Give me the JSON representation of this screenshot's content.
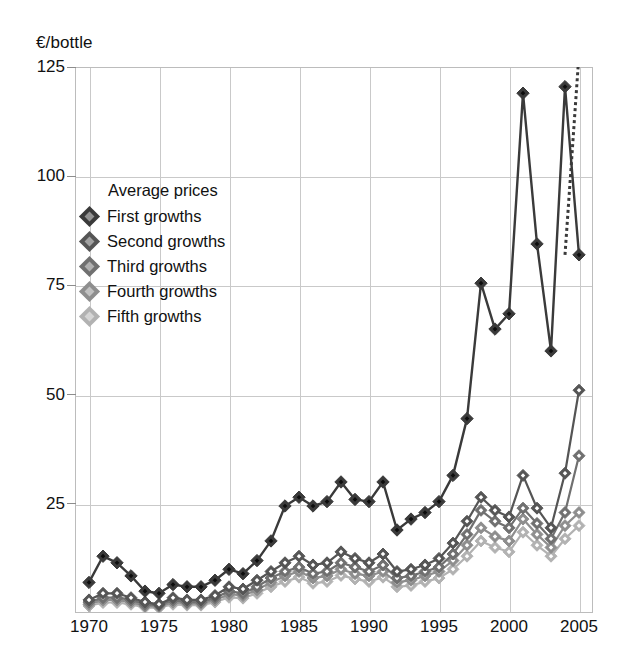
{
  "chart_data": {
    "type": "line",
    "title": "",
    "ylabel": "€/bottle",
    "xlabel": "",
    "xlim": [
      1969,
      2006
    ],
    "ylim": [
      0,
      125
    ],
    "yticks": [
      0,
      25,
      50,
      75,
      100,
      125
    ],
    "ytick_labels": [
      "",
      "25",
      "50",
      "75",
      "100",
      "125"
    ],
    "xticks": [
      1970,
      1975,
      1980,
      1985,
      1990,
      1995,
      2000,
      2005
    ],
    "xtick_labels": [
      "1970",
      "1975",
      "1980",
      "1985",
      "1990",
      "1995",
      "2000",
      "2005"
    ],
    "grid": true,
    "legend_position": "upper-left",
    "legend_title": "Average prices",
    "x": [
      1970,
      1971,
      1972,
      1973,
      1974,
      1975,
      1976,
      1977,
      1978,
      1979,
      1980,
      1981,
      1982,
      1983,
      1984,
      1985,
      1986,
      1987,
      1988,
      1989,
      1990,
      1991,
      1992,
      1993,
      1994,
      1995,
      1996,
      1997,
      1998,
      1999,
      2000,
      2001,
      2002,
      2003,
      2004,
      2005
    ],
    "series": [
      {
        "name": "First growths",
        "color": "#3a3a3a",
        "values": [
          7.0,
          13.0,
          11.5,
          8.5,
          5.0,
          4.5,
          6.5,
          6.0,
          6.0,
          7.5,
          10.0,
          9.0,
          12.0,
          16.5,
          24.5,
          26.5,
          24.5,
          25.5,
          30.0,
          26.0,
          25.5,
          30.0,
          19.0,
          21.5,
          23.0,
          25.5,
          31.5,
          44.5,
          75.5,
          65.0,
          68.5,
          119.0,
          84.5,
          60.0,
          120.5,
          82.0
        ],
        "dashed_tail": {
          "from_year": 2004,
          "from_value": 82.0,
          "to_year": 2005,
          "to_value": 128.0,
          "note": "dotted projection segment rising off the top of the plot"
        }
      },
      {
        "name": "Second growths",
        "color": "#555555",
        "values": [
          3.0,
          4.5,
          4.5,
          3.5,
          2.5,
          2.0,
          3.5,
          3.0,
          3.0,
          4.0,
          6.0,
          5.5,
          7.5,
          9.5,
          11.5,
          13.0,
          11.0,
          11.5,
          14.0,
          12.5,
          11.5,
          13.5,
          9.5,
          10.0,
          11.0,
          12.5,
          16.0,
          21.0,
          26.5,
          23.5,
          22.0,
          31.5,
          24.0,
          19.5,
          32.0,
          51.0
        ]
      },
      {
        "name": "Third growths",
        "color": "#707070",
        "values": [
          2.5,
          3.5,
          3.5,
          3.0,
          2.0,
          1.8,
          3.0,
          2.5,
          2.5,
          3.5,
          5.0,
          4.5,
          6.0,
          8.0,
          9.5,
          10.5,
          9.0,
          9.5,
          11.5,
          10.5,
          9.5,
          11.0,
          8.0,
          8.5,
          9.5,
          10.5,
          13.5,
          18.0,
          23.5,
          21.0,
          19.5,
          24.0,
          20.5,
          17.0,
          23.0,
          36.0
        ]
      },
      {
        "name": "Fourth growths",
        "color": "#8e8e8e",
        "values": [
          2.0,
          3.0,
          3.0,
          2.5,
          1.6,
          1.5,
          2.5,
          2.2,
          2.2,
          3.0,
          4.3,
          4.0,
          5.3,
          7.0,
          8.5,
          9.5,
          8.0,
          8.5,
          10.0,
          9.0,
          8.5,
          9.5,
          7.0,
          7.5,
          8.5,
          9.5,
          12.0,
          15.5,
          19.5,
          17.5,
          16.5,
          21.5,
          18.0,
          15.0,
          20.0,
          23.0
        ]
      },
      {
        "name": "Fifth growths",
        "color": "#b2b2b2",
        "values": [
          1.6,
          2.4,
          2.4,
          2.0,
          1.3,
          1.2,
          2.0,
          1.8,
          1.8,
          2.5,
          3.6,
          3.4,
          4.5,
          6.0,
          7.2,
          8.2,
          6.8,
          7.2,
          8.6,
          7.8,
          7.2,
          8.2,
          6.0,
          6.3,
          7.2,
          8.0,
          10.0,
          13.0,
          16.5,
          15.0,
          14.0,
          18.5,
          15.5,
          13.0,
          17.0,
          20.0
        ]
      }
    ]
  },
  "legend": {
    "title": "Average prices",
    "items": [
      {
        "label": "First growths",
        "color": "#3a3a3a"
      },
      {
        "label": "Second growths",
        "color": "#555555"
      },
      {
        "label": "Third growths",
        "color": "#707070"
      },
      {
        "label": "Fourth growths",
        "color": "#8e8e8e"
      },
      {
        "label": "Fifth growths",
        "color": "#b2b2b2"
      }
    ]
  }
}
